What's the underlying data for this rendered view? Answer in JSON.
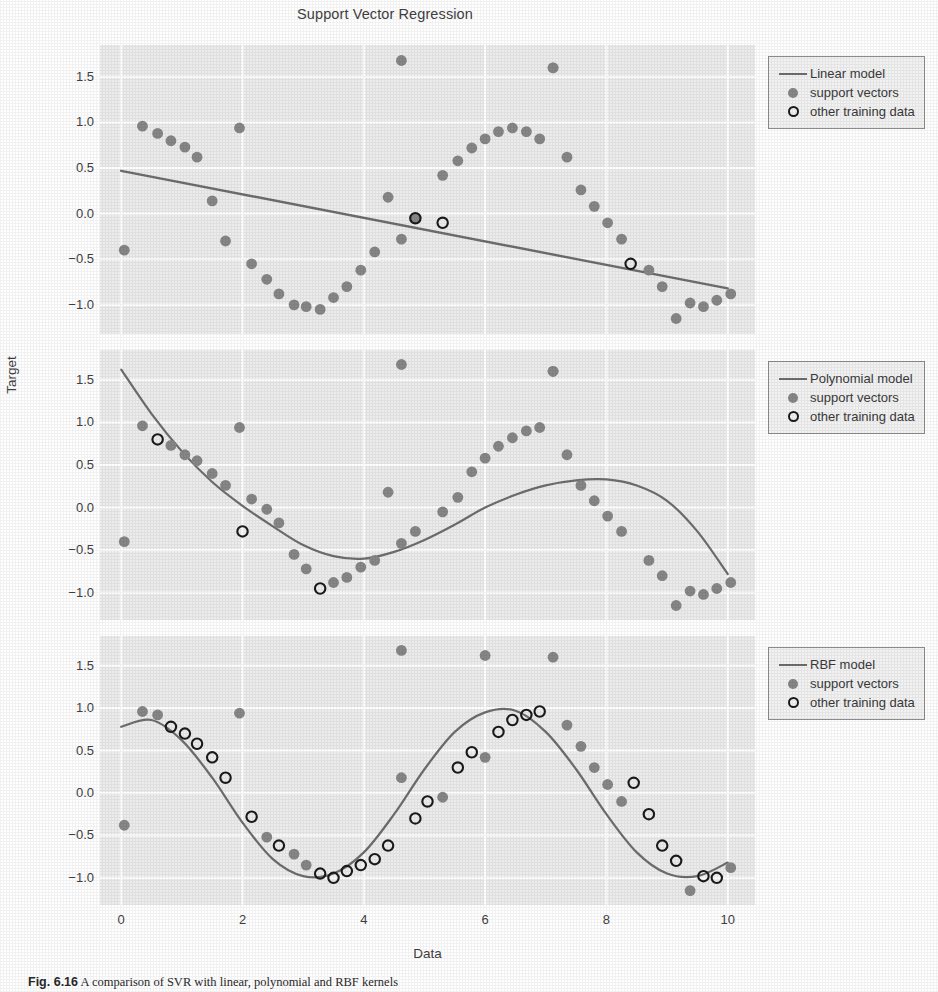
{
  "figure": {
    "title": "Support Vector Regression",
    "xlabel": "Data",
    "ylabel": "Target",
    "caption_prefix": "Fig. 6.16",
    "caption_text": "A comparison of SVR with linear, polynomial and RBF kernels"
  },
  "axes": {
    "xticks": [
      "0",
      "2",
      "4",
      "6",
      "8",
      "10"
    ],
    "xtick_values": [
      0,
      2,
      4,
      6,
      8,
      10
    ],
    "yticks": [
      "1.5",
      "1.0",
      "0.5",
      "0.0",
      "−0.5",
      "−1.0"
    ],
    "ytick_values": [
      1.5,
      1.0,
      0.5,
      0.0,
      -0.5,
      -1.0
    ],
    "xlim": [
      -0.35,
      10.45
    ],
    "ylim": [
      -1.32,
      1.85
    ],
    "grid": true
  },
  "colors": {
    "panel_background": "#ececec",
    "gridline": "#ffffff",
    "support_vector": "#878787",
    "other_training_data_edge": "#1a1a1a",
    "model_line": "#6e6e6e",
    "text": "#3f3f3f",
    "legend_background": "#f2f2f2",
    "legend_border": "#8d8d8d"
  },
  "legend_common": {
    "support_vectors": "support vectors",
    "other_training_data": "other training data"
  },
  "chart_data": [
    {
      "type": "scatter",
      "panel": 1,
      "title": "Support Vector Regression",
      "model_label": "Linear model",
      "legend": [
        "Linear model",
        "support vectors",
        "other training data"
      ],
      "legend_position": "upper right outside",
      "xlabel": "",
      "ylabel": "Target",
      "xlim": [
        -0.35,
        10.45
      ],
      "ylim": [
        -1.32,
        1.85
      ],
      "model_type": "line",
      "model_line": {
        "x": [
          0.0,
          10.0
        ],
        "y": [
          0.47,
          -0.82
        ]
      },
      "support_vectors": {
        "x": [
          0.05,
          0.35,
          0.6,
          0.82,
          1.05,
          1.25,
          1.5,
          1.72,
          1.95,
          2.15,
          2.4,
          2.6,
          2.85,
          3.05,
          3.28,
          3.5,
          3.72,
          3.95,
          4.18,
          4.4,
          4.62,
          4.85,
          5.3,
          5.55,
          5.78,
          6.0,
          6.22,
          6.45,
          6.68,
          6.9,
          7.12,
          7.35,
          7.58,
          7.8,
          8.02,
          8.25,
          8.7,
          8.92,
          9.15,
          9.38,
          9.6,
          9.82,
          10.05
        ],
        "y": [
          -0.4,
          0.96,
          0.88,
          0.8,
          0.73,
          0.62,
          0.14,
          -0.3,
          0.94,
          -0.55,
          -0.72,
          -0.88,
          -1.0,
          -1.02,
          -1.05,
          -0.92,
          -0.8,
          -0.62,
          -0.42,
          0.18,
          -0.28,
          -0.05,
          0.42,
          0.58,
          0.72,
          0.82,
          0.9,
          0.94,
          0.9,
          0.82,
          1.6,
          0.62,
          0.26,
          0.08,
          -0.1,
          -0.28,
          -0.62,
          -0.8,
          -1.15,
          -0.98,
          -1.02,
          -0.95,
          -0.88
        ]
      },
      "other_training_data": {
        "x": [
          4.85,
          5.3,
          8.4
        ],
        "y": [
          -0.05,
          -0.1,
          -0.55
        ]
      },
      "outliers": {
        "x": [
          4.62,
          7.12
        ],
        "y": [
          1.68,
          1.6
        ]
      }
    },
    {
      "type": "scatter",
      "panel": 2,
      "model_label": "Polynomial model",
      "legend": [
        "Polynomial model",
        "support vectors",
        "other training data"
      ],
      "legend_position": "upper right outside",
      "xlabel": "",
      "ylabel": "Target",
      "xlim": [
        -0.35,
        10.45
      ],
      "ylim": [
        -1.32,
        1.85
      ],
      "model_type": "cubic",
      "model_curve_points": {
        "x": [
          0.0,
          0.5,
          1.0,
          1.5,
          2.0,
          2.5,
          3.0,
          3.5,
          4.0,
          4.5,
          5.0,
          5.5,
          6.0,
          6.5,
          7.0,
          7.5,
          8.0,
          8.5,
          9.0,
          9.5,
          10.0
        ],
        "y": [
          1.62,
          1.1,
          0.66,
          0.3,
          0.02,
          -0.22,
          -0.44,
          -0.57,
          -0.6,
          -0.52,
          -0.38,
          -0.2,
          0.0,
          0.15,
          0.26,
          0.32,
          0.33,
          0.26,
          0.08,
          -0.28,
          -0.78
        ]
      },
      "support_vectors": {
        "x": [
          0.05,
          0.35,
          0.82,
          1.05,
          1.25,
          1.5,
          1.72,
          1.95,
          2.15,
          2.4,
          2.6,
          2.85,
          3.05,
          3.5,
          3.72,
          3.95,
          4.18,
          4.4,
          4.62,
          4.85,
          5.3,
          5.55,
          5.78,
          6.0,
          6.22,
          6.45,
          6.68,
          6.9,
          7.12,
          7.35,
          7.58,
          7.8,
          8.02,
          8.25,
          8.7,
          8.92,
          9.15,
          9.38,
          9.6,
          9.82,
          10.05
        ],
        "y": [
          -0.4,
          0.96,
          0.73,
          0.62,
          0.55,
          0.4,
          0.26,
          0.94,
          0.1,
          -0.02,
          -0.18,
          -0.55,
          -0.72,
          -0.88,
          -0.82,
          -0.7,
          -0.62,
          0.18,
          -0.42,
          -0.28,
          -0.05,
          0.12,
          0.42,
          0.58,
          0.72,
          0.82,
          0.9,
          0.94,
          1.6,
          0.62,
          0.26,
          0.08,
          -0.1,
          -0.28,
          -0.62,
          -0.8,
          -1.15,
          -0.98,
          -1.02,
          -0.95,
          -0.88
        ]
      },
      "other_training_data": {
        "x": [
          0.6,
          2.0,
          3.28
        ],
        "y": [
          0.8,
          -0.28,
          -0.95
        ]
      },
      "outliers": {
        "x": [
          4.62,
          7.12
        ],
        "y": [
          1.68,
          1.6
        ]
      }
    },
    {
      "type": "scatter",
      "panel": 3,
      "model_label": "RBF model",
      "legend": [
        "RBF model",
        "support vectors",
        "other training data"
      ],
      "legend_position": "upper right outside",
      "xlabel": "Data",
      "ylabel": "Target",
      "xlim": [
        -0.35,
        10.45
      ],
      "ylim": [
        -1.32,
        1.85
      ],
      "model_type": "sine",
      "model_curve_points": {
        "x": [
          0.0,
          0.5,
          1.0,
          1.5,
          2.0,
          2.5,
          3.0,
          3.5,
          4.0,
          4.5,
          5.0,
          5.5,
          6.0,
          6.5,
          7.0,
          7.5,
          8.0,
          8.5,
          9.0,
          9.5,
          10.0
        ],
        "y": [
          0.78,
          0.86,
          0.62,
          0.18,
          -0.35,
          -0.78,
          -0.98,
          -0.95,
          -0.7,
          -0.25,
          0.28,
          0.72,
          0.95,
          0.97,
          0.72,
          0.28,
          -0.25,
          -0.7,
          -0.95,
          -0.98,
          -0.82
        ]
      },
      "support_vectors": {
        "x": [
          0.05,
          0.35,
          0.6,
          1.95,
          2.4,
          2.85,
          3.05,
          4.62,
          5.3,
          6.0,
          7.12,
          7.35,
          7.58,
          7.8,
          8.02,
          8.25,
          9.38,
          10.05
        ],
        "y": [
          -0.38,
          0.96,
          0.92,
          0.94,
          -0.52,
          -0.72,
          -0.85,
          0.18,
          -0.05,
          0.42,
          1.6,
          0.8,
          0.55,
          0.3,
          0.1,
          -0.1,
          -1.15,
          -0.88
        ]
      },
      "other_training_data": {
        "x": [
          0.82,
          1.05,
          1.25,
          1.5,
          1.72,
          2.15,
          2.6,
          3.28,
          3.5,
          3.72,
          3.95,
          4.18,
          4.4,
          4.85,
          5.05,
          5.55,
          5.78,
          6.22,
          6.45,
          6.68,
          6.9,
          8.45,
          8.7,
          8.92,
          9.15,
          9.6,
          9.82
        ],
        "y": [
          0.78,
          0.7,
          0.58,
          0.42,
          0.18,
          -0.28,
          -0.62,
          -0.95,
          -1.0,
          -0.92,
          -0.85,
          -0.78,
          -0.62,
          -0.3,
          -0.1,
          0.3,
          0.48,
          0.72,
          0.86,
          0.92,
          0.96,
          0.12,
          -0.25,
          -0.62,
          -0.8,
          -0.98,
          -1.0
        ]
      },
      "outliers": {
        "x": [
          4.62,
          6.0
        ],
        "y": [
          1.68,
          1.62
        ]
      }
    }
  ]
}
